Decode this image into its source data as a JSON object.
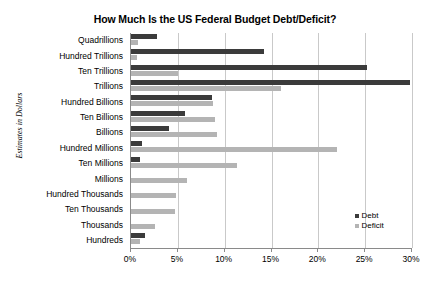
{
  "chart_data": {
    "type": "bar",
    "orientation": "horizontal",
    "title": "How Much Is the US Federal Budget Debt/Deficit?",
    "xlabel": "",
    "ylabel": "Estimates in Dollars",
    "xlim": [
      0,
      30
    ],
    "xunit": "%",
    "grid": true,
    "legend_position": "bottom-right",
    "xticks": [
      {
        "value": 0,
        "label": "0%"
      },
      {
        "value": 5,
        "label": "5%"
      },
      {
        "value": 10,
        "label": "10%"
      },
      {
        "value": 15,
        "label": "15%"
      },
      {
        "value": 20,
        "label": "20%"
      },
      {
        "value": 25,
        "label": "25%"
      },
      {
        "value": 30,
        "label": "30%"
      }
    ],
    "categories": [
      "Quadrillions",
      "Hundred Trillions",
      "Ten Trillions",
      "Trillions",
      "Hundred Billions",
      "Ten Billions",
      "Billions",
      "Hundred Millions",
      "Ten Millions",
      "Millions",
      "Hundred Thousands",
      "Ten Thousands",
      "Thousands",
      "Hundreds"
    ],
    "series": [
      {
        "name": "Debt",
        "color": "#3b3b3b",
        "values": [
          2.8,
          14.2,
          25.2,
          29.8,
          8.6,
          5.8,
          4.1,
          1.2,
          1.0,
          0.0,
          0.0,
          0.0,
          0.0,
          1.5
        ]
      },
      {
        "name": "Deficit",
        "color": "#b4b4b4",
        "values": [
          0.7,
          0.6,
          5.0,
          16.0,
          8.8,
          9.0,
          9.2,
          22.0,
          11.3,
          6.0,
          4.8,
          4.7,
          2.6,
          1.0
        ]
      }
    ]
  },
  "legend": {
    "items": [
      {
        "label": "Debt",
        "color": "#3b3b3b"
      },
      {
        "label": "Deficit",
        "color": "#b4b4b4"
      }
    ]
  }
}
